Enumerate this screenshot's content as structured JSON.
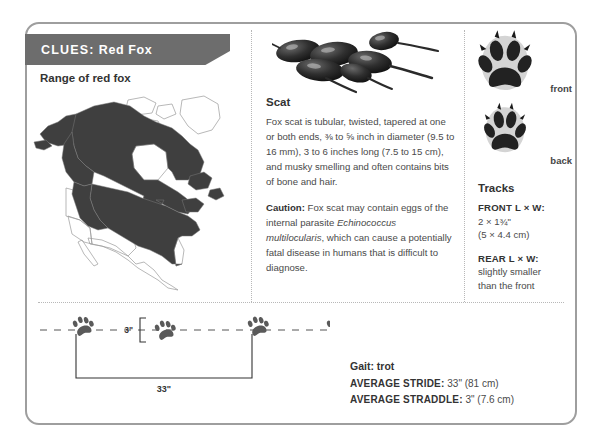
{
  "card": {
    "banner": {
      "lead": "CLUES:",
      "subject": "Red Fox"
    }
  },
  "map": {
    "title": "Range of red fox",
    "region": "North America",
    "shade_color": "#3f3f3f",
    "outline_color": "#9a9a9a"
  },
  "scat": {
    "heading": "Scat",
    "description": "Fox scat is tubular, twisted, tapered at one or both ends, ⅜ to ⅝ inch in diameter (9.5 to 16 mm), 3 to 6 inches long (7.5 to 15 cm), and musky smelling and often contains bits of bone and hair.",
    "caution_label": "Caution:",
    "caution_pre": " Fox scat may contain eggs of the internal parasite ",
    "caution_italic": "Echinococcus multilocularis",
    "caution_post": ", which can cause a potentially fatal disease in humans that is difficult to diagnose."
  },
  "paws": {
    "front_label": "front",
    "back_label": "back",
    "pad_color": "#2b2b2b",
    "sole_color": "#d6d6d6"
  },
  "tracks": {
    "heading": "Tracks",
    "items": [
      {
        "key": "FRONT L × W:",
        "value_imperial": "2 × 1¾\"",
        "value_metric": "(5 × 4.4 cm)"
      },
      {
        "key": "REAR L × W:",
        "value_imperial": "slightly smaller",
        "value_metric": "than the front"
      }
    ]
  },
  "trail": {
    "straddle_label": "3\"",
    "stride_label": "33\"",
    "print_count": 4
  },
  "gait": {
    "title": "Gait: trot",
    "stride_key": "AVERAGE STRIDE:",
    "stride_value": " 33\" (81 cm)",
    "straddle_key": "AVERAGE STRADDLE:",
    "straddle_value": " 3\" (7.6 cm)"
  }
}
